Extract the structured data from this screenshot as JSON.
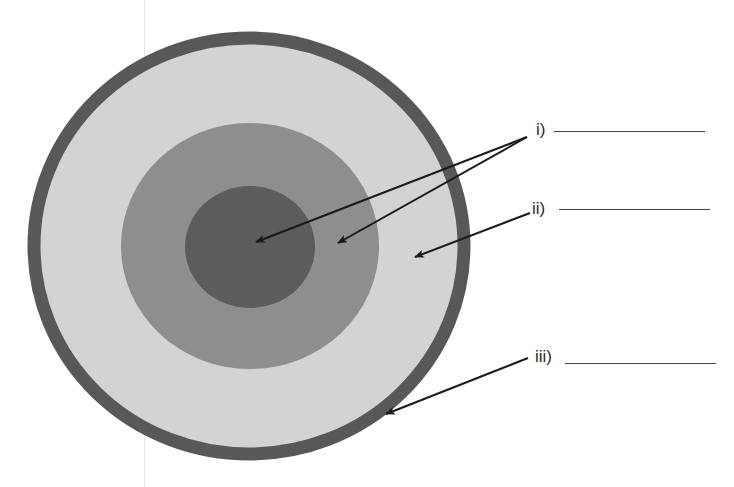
{
  "diagram": {
    "type": "concentric-layers",
    "colors": {
      "outer_border": "#585858",
      "outer_layer": "#d3d3d3",
      "middle_layer": "#8e8e8e",
      "core": "#5c5c5c",
      "arrow": "#1a1a1a"
    },
    "labels": [
      {
        "id": "i",
        "text": "i)",
        "blank": ""
      },
      {
        "id": "ii",
        "text": "ii)",
        "blank": ""
      },
      {
        "id": "iii",
        "text": "iii)",
        "blank": ""
      }
    ]
  }
}
